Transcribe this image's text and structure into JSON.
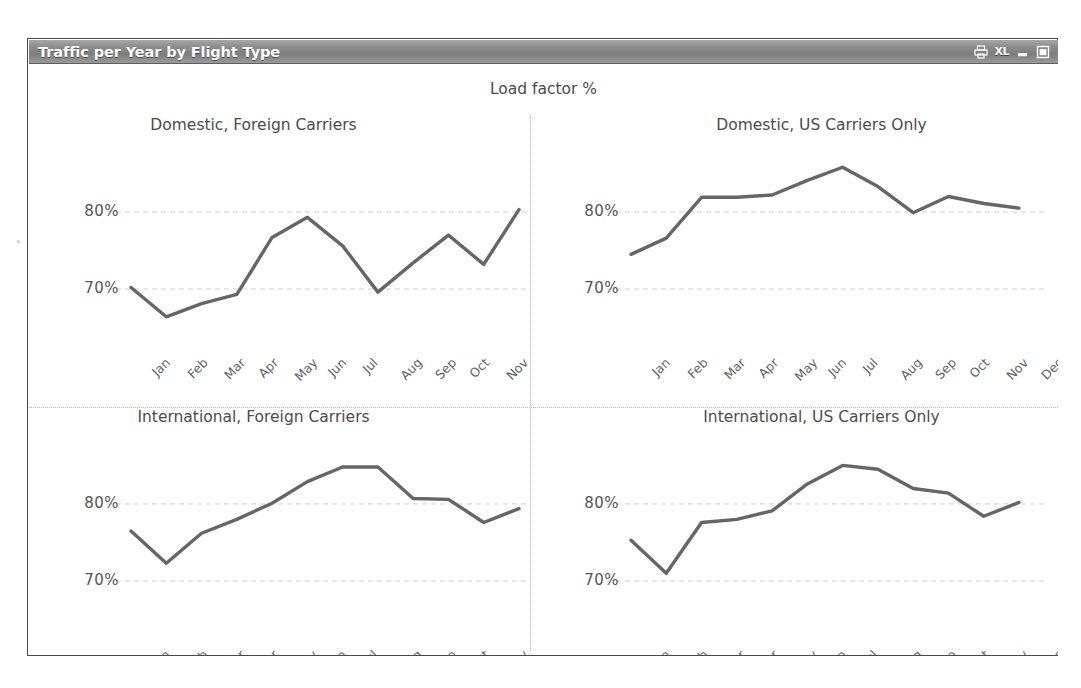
{
  "window": {
    "title": "Traffic per Year by Flight Type",
    "controls": [
      {
        "name": "print-icon",
        "label": "print"
      },
      {
        "name": "excel-icon",
        "label": "XL"
      },
      {
        "name": "minimize-icon",
        "label": "minimize"
      },
      {
        "name": "maximize-icon",
        "label": "maximize"
      }
    ]
  },
  "measure_title": "Load factor %",
  "colors": {
    "line": "#666666",
    "gridline": "#cfcfcf",
    "text": "#4c4c4c",
    "titlebar_text": "#ffffff",
    "divider": "#b6b6b6"
  },
  "chart_data": [
    {
      "type": "line",
      "title": "Domestic, Foreign Carriers",
      "xlabel": "",
      "ylabel": "Load factor %",
      "ylim": [
        63,
        87
      ],
      "yticks": [
        70,
        80
      ],
      "ytick_labels": [
        "70%",
        "80%"
      ],
      "grid": true,
      "legend": "none",
      "categories": [
        "Jan",
        "Feb",
        "Mar",
        "Apr",
        "May",
        "Jun",
        "Jul",
        "Aug",
        "Sep",
        "Oct",
        "Nov",
        "Dec"
      ],
      "values": [
        70.2,
        66.4,
        68.1,
        69.3,
        76.7,
        79.3,
        75.6,
        69.6,
        73.4,
        77.0,
        73.2,
        80.3
      ]
    },
    {
      "type": "line",
      "title": "Domestic, US Carriers Only",
      "xlabel": "",
      "ylabel": "Load factor %",
      "ylim": [
        63,
        87
      ],
      "yticks": [
        70,
        80
      ],
      "ytick_labels": [
        "70%",
        "80%"
      ],
      "grid": true,
      "legend": "none",
      "categories": [
        "Jan",
        "Feb",
        "Mar",
        "Apr",
        "May",
        "Jun",
        "Jul",
        "Aug",
        "Sep",
        "Oct",
        "Nov",
        "Dec"
      ],
      "values": [
        74.5,
        76.6,
        81.9,
        81.9,
        82.2,
        84.1,
        85.8,
        83.3,
        79.9,
        82.0,
        81.1,
        80.5
      ]
    },
    {
      "type": "line",
      "title": "International, Foreign Carriers",
      "xlabel": "",
      "ylabel": "Load factor %",
      "ylim": [
        63,
        87
      ],
      "yticks": [
        70,
        80
      ],
      "ytick_labels": [
        "70%",
        "80%"
      ],
      "grid": true,
      "legend": "none",
      "categories": [
        "Jan",
        "Feb",
        "Mar",
        "Apr",
        "May",
        "Jun",
        "Jul",
        "Aug",
        "Sep",
        "Oct",
        "Nov",
        "Dec"
      ],
      "values": [
        76.5,
        72.3,
        76.2,
        78.0,
        80.1,
        82.9,
        84.8,
        84.8,
        80.7,
        80.6,
        77.6,
        79.4
      ]
    },
    {
      "type": "line",
      "title": "International, US Carriers Only",
      "xlabel": "",
      "ylabel": "Load factor %",
      "ylim": [
        63,
        87
      ],
      "yticks": [
        70,
        80
      ],
      "ytick_labels": [
        "70%",
        "80%"
      ],
      "grid": true,
      "legend": "none",
      "categories": [
        "Jan",
        "Feb",
        "Mar",
        "Apr",
        "May",
        "Jun",
        "Jul",
        "Aug",
        "Sep",
        "Oct",
        "Nov",
        "Dec"
      ],
      "values": [
        75.3,
        71.0,
        77.6,
        78.0,
        79.1,
        82.6,
        85.0,
        84.5,
        82.0,
        81.4,
        78.4,
        80.2
      ]
    }
  ]
}
